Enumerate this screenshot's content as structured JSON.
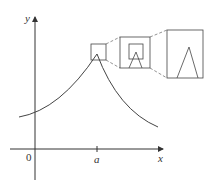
{
  "figure": {
    "axes": {
      "x_label": "x",
      "y_label": "y",
      "origin_label": "0",
      "tick_label": "a"
    },
    "zoom_levels": 3,
    "colors": {
      "line": "#444444",
      "axis": "#333333",
      "dashed": "#666666"
    }
  }
}
